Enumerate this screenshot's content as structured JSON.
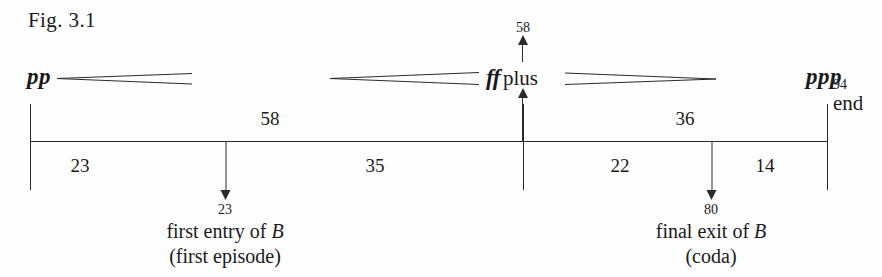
{
  "figure": {
    "label": "Fig. 3.1",
    "type": "musical-form-timeline"
  },
  "dynamics": {
    "start": "pp",
    "peak_prefix": "ff",
    "peak_suffix": "plus",
    "end": "ppp",
    "peak_bar": "58"
  },
  "timeline": {
    "end_number": "94",
    "end_word": "end",
    "upper_spans": [
      {
        "label": "58",
        "center": 270
      },
      {
        "label": "36",
        "center": 685
      }
    ],
    "lower_spans": [
      {
        "label": "23",
        "center": 80
      },
      {
        "label": "35",
        "center": 375
      },
      {
        "label": "22",
        "center": 620
      },
      {
        "label": "14",
        "center": 765
      }
    ]
  },
  "events": [
    {
      "bar": "23",
      "caption_line1_pre": "first entry of ",
      "caption_line1_em": "B",
      "caption_line2": "(first episode)",
      "center": 225
    },
    {
      "bar": "80",
      "caption_line1_pre": "final exit of ",
      "caption_line1_em": "B",
      "caption_line2": "(coda)",
      "center": 711
    }
  ],
  "hairpins": [
    {
      "name": "crescendo-1",
      "x1": 57,
      "x2": 192,
      "open": "right"
    },
    {
      "name": "crescendo-2",
      "x1": 330,
      "x2": 479,
      "open": "right"
    },
    {
      "name": "diminuendo-1",
      "x1": 565,
      "x2": 716,
      "open": "left"
    }
  ],
  "colors": {
    "ink": "#1a1a1a",
    "rule": "#2a2a2a",
    "paper": "#fefefe"
  }
}
